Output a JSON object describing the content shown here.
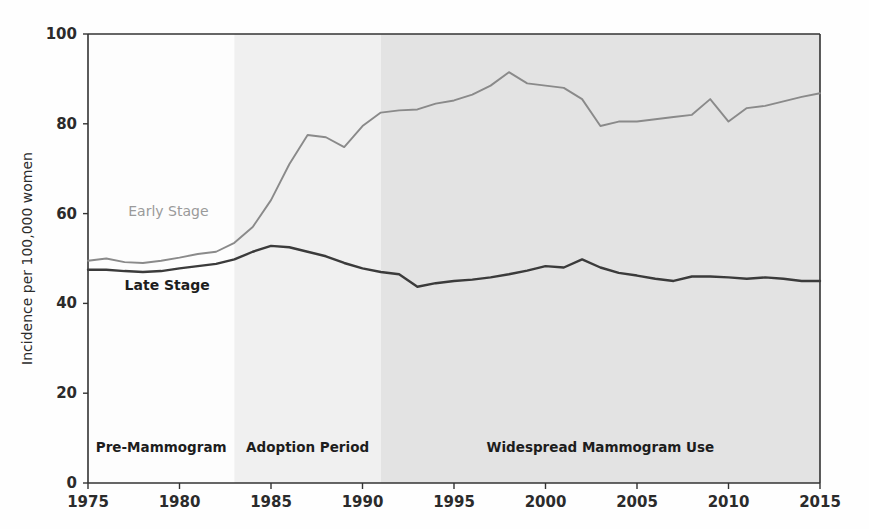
{
  "chart_data": {
    "type": "line",
    "title": "",
    "xlabel": "",
    "ylabel": "Incidence per 100,000 women",
    "xlim": [
      1975,
      2015
    ],
    "ylim": [
      0,
      100
    ],
    "grid": false,
    "legend_position": "inline-annotations",
    "xticks": [
      "1975",
      "1980",
      "1985",
      "1990",
      "1995",
      "2000",
      "2005",
      "2010",
      "2015"
    ],
    "xtick_values": [
      1975,
      1980,
      1985,
      1990,
      1995,
      2000,
      2005,
      2010,
      2015
    ],
    "yticks": [
      "0",
      "20",
      "40",
      "60",
      "80",
      "100"
    ],
    "ytick_values": [
      0,
      20,
      40,
      60,
      80,
      100
    ],
    "x": [
      1975,
      1976,
      1977,
      1978,
      1979,
      1980,
      1981,
      1982,
      1983,
      1984,
      1985,
      1986,
      1987,
      1988,
      1989,
      1990,
      1991,
      1992,
      1993,
      1994,
      1995,
      1996,
      1997,
      1998,
      1999,
      2000,
      2001,
      2002,
      2003,
      2004,
      2005,
      2006,
      2007,
      2008,
      2009,
      2010,
      2011,
      2012,
      2013,
      2014,
      2015
    ],
    "series": [
      {
        "name": "Early Stage",
        "color": "#8a8a8a",
        "values": [
          49.5,
          50.0,
          49.2,
          49.0,
          49.5,
          50.2,
          51.0,
          51.5,
          53.5,
          57.0,
          63.0,
          71.0,
          77.5,
          77.0,
          74.8,
          79.5,
          82.5,
          83.0,
          83.2,
          84.5,
          85.2,
          86.5,
          88.5,
          91.5,
          89.0,
          88.5,
          88.0,
          85.5,
          79.5,
          80.5,
          80.5,
          81.0,
          81.5,
          82.0,
          85.5,
          80.5,
          83.5,
          84.0,
          85.0,
          86.0,
          86.8
        ]
      },
      {
        "name": "Late Stage",
        "color": "#3b3b3b",
        "values": [
          47.5,
          47.5,
          47.2,
          47.0,
          47.2,
          47.8,
          48.3,
          48.8,
          49.8,
          51.5,
          52.8,
          52.5,
          51.5,
          50.5,
          49.0,
          47.8,
          47.0,
          46.5,
          43.7,
          44.5,
          45.0,
          45.3,
          45.8,
          46.5,
          47.3,
          48.3,
          48.0,
          49.8,
          48.0,
          46.8,
          46.2,
          45.5,
          45.0,
          46.0,
          46.0,
          45.8,
          45.5,
          45.8,
          45.5,
          45.0,
          45.0
        ]
      }
    ],
    "bands": [
      {
        "label": "Pre-Mammogram",
        "start": 1983,
        "end": 1975,
        "x0": 1975,
        "x1": 1983,
        "color": "#fdfdfd",
        "label_x": 1979,
        "label_y": 7
      },
      {
        "label": "Adoption Period",
        "x0": 1983,
        "x1": 1991,
        "color": "#f0f0f0",
        "label_x": 1987,
        "label_y": 7
      },
      {
        "label": "Widespread Mammogram Use",
        "x0": 1991,
        "x1": 2015,
        "color": "#e3e3e3",
        "label_x": 2003,
        "label_y": 7
      }
    ],
    "annotations": [
      {
        "text": "Early Stage",
        "x": 1977.2,
        "y": 59.5,
        "style": "early"
      },
      {
        "text": "Late Stage",
        "x": 1977.0,
        "y": 43.0,
        "style": "late"
      }
    ]
  }
}
